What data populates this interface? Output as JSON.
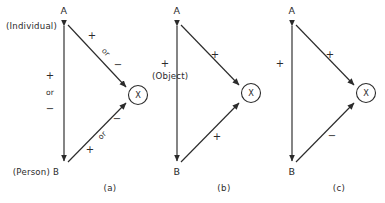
{
  "figure": {
    "background_color": "#ffffff",
    "ink_color": "#2b2b2b",
    "panels": [
      {
        "id": "a",
        "caption": "(a)",
        "nodes": {
          "top": {
            "label": "A",
            "paren_label": "(Individual)"
          },
          "bottom": {
            "label": "B",
            "paren_label": "(Person) B"
          },
          "object": {
            "label": "X",
            "paren_label": "(Object)"
          }
        },
        "edges": [
          {
            "name": "vertical-A-B",
            "signs": [
              "+",
              "or",
              "−"
            ]
          },
          {
            "name": "diagonal-A-X",
            "signs": [
              "+",
              "or",
              "−"
            ]
          },
          {
            "name": "diagonal-B-X",
            "signs": [
              "−",
              "or",
              "+"
            ]
          }
        ]
      },
      {
        "id": "b",
        "caption": "(b)",
        "nodes": {
          "top": {
            "label": "A"
          },
          "bottom": {
            "label": "B"
          },
          "object": {
            "label": "X"
          }
        },
        "edges": [
          {
            "name": "vertical-A-B",
            "signs": [
              "+"
            ]
          },
          {
            "name": "diagonal-A-X",
            "signs": [
              "+"
            ]
          },
          {
            "name": "diagonal-B-X",
            "signs": [
              "+"
            ]
          }
        ]
      },
      {
        "id": "c",
        "caption": "(c)",
        "nodes": {
          "top": {
            "label": "A"
          },
          "bottom": {
            "label": "B"
          },
          "object": {
            "label": "X"
          }
        },
        "edges": [
          {
            "name": "vertical-A-B",
            "signs": [
              "+"
            ]
          },
          {
            "name": "diagonal-A-X",
            "signs": [
              "+"
            ]
          },
          {
            "name": "diagonal-B-X",
            "signs": [
              "−"
            ]
          }
        ]
      }
    ]
  },
  "panel_a": {
    "node_a": "A",
    "node_b": "B",
    "node_x": "X",
    "individual": "(Individual)",
    "person": "(Person) B",
    "object": "(Object)",
    "vert_plus": "+",
    "vert_or": "or",
    "vert_minus": "−",
    "up_plus": "+",
    "up_or": "or",
    "up_minus": "−",
    "low_minus": "−",
    "low_or": "or",
    "low_plus": "+",
    "caption": "(a)"
  },
  "panel_b": {
    "node_a": "A",
    "node_b": "B",
    "node_x": "X",
    "vert_plus": "+",
    "up_plus": "+",
    "low_plus": "+",
    "caption": "(b)"
  },
  "panel_c": {
    "node_a": "A",
    "node_b": "B",
    "node_x": "X",
    "vert_plus": "+",
    "up_plus": "+",
    "low_minus": "−",
    "caption": "(c)"
  }
}
